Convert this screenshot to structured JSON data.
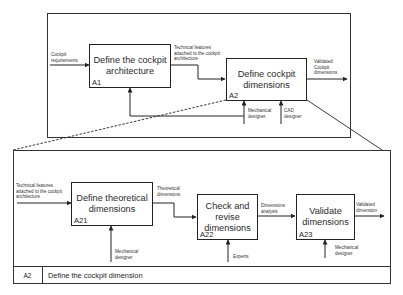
{
  "top_diagram": {
    "boxes": [
      {
        "id": "A1",
        "title": "Define the cockpit architecture"
      },
      {
        "id": "A2",
        "title": "Define cockpit dimensions"
      }
    ],
    "inputs": {
      "a1_input": "Cockpit requirements",
      "a1_to_a2": "Technical features attached to the cockpit architecture",
      "a2_output": "Validated Cockpit dimensions"
    },
    "mechanisms": {
      "a2_mech1": "Mechanical designer",
      "a2_mech2": "CAD designer"
    }
  },
  "bottom_diagram": {
    "boxes": [
      {
        "id": "A21",
        "title": "Define theoretical dimensions"
      },
      {
        "id": "A22",
        "title": "Check and revise dimensions"
      },
      {
        "id": "A23",
        "title": "Validate dimensions"
      }
    ],
    "flows": {
      "a21_input": "Technical features attached to the cockpit architecture",
      "a21_to_a22": "Theoretical dimensions",
      "a22_to_a23": "Dimensions analysis",
      "a23_output": "Validated dimension"
    },
    "mechanisms": {
      "a21_mech": "Mechanical designer",
      "a22_mech": "Experts",
      "a23_mech": "Mechanical designer"
    },
    "footer": {
      "node_id": "A2",
      "node_title": "Define the cockpit dimension"
    }
  },
  "colors": {
    "line": "#222222",
    "background": "#ffffff"
  }
}
